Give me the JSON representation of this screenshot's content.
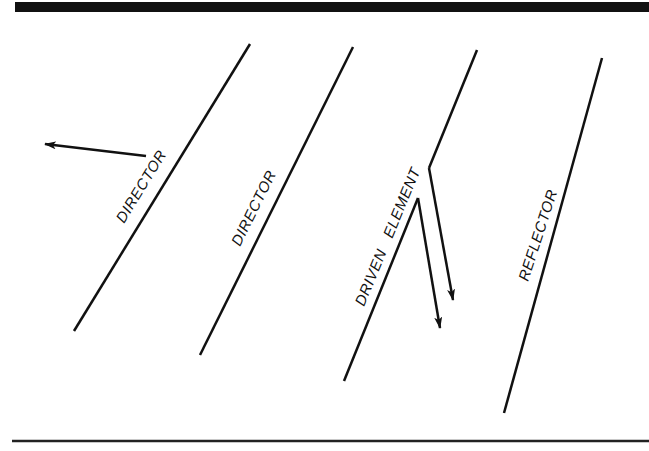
{
  "diagram": {
    "type": "yagi-antenna-array",
    "colors": {
      "ink": "#111111",
      "background": "#ffffff"
    },
    "elements": [
      {
        "id": "director-1",
        "label": "DIRECTOR"
      },
      {
        "id": "director-2",
        "label": "DIRECTOR"
      },
      {
        "id": "driven-element",
        "label": "DRIVEN   ELEMENT"
      },
      {
        "id": "reflector",
        "label": "REFLECTOR"
      }
    ],
    "direction_arrow": "direction-of-radiation-arrow",
    "feedline": "two-wire-feed"
  }
}
